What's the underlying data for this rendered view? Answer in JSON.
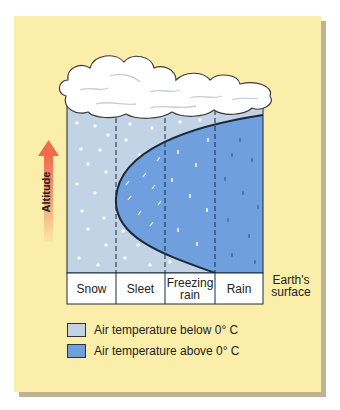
{
  "diagram": {
    "axis_label": "Altitude",
    "columns": [
      {
        "label": "Snow"
      },
      {
        "label": "Sleet"
      },
      {
        "label": "Freezing rain"
      },
      {
        "label": "Rain"
      }
    ],
    "surface_label": "Earth's surface",
    "legend": [
      {
        "label": "Air temperature below 0° C",
        "color": "#c3d3e6"
      },
      {
        "label": "Air temperature above 0° C",
        "color": "#6f9fdc"
      }
    ],
    "colors": {
      "panel_bg": "#fbeeab",
      "cold_air": "#c3d3e6",
      "warm_air": "#6f9fdc",
      "arrow": "#f06a4e",
      "outline": "#1b2a3a"
    }
  }
}
